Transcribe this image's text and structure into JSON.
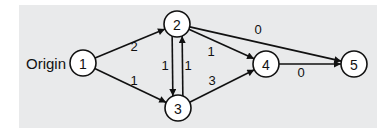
{
  "diagram": {
    "type": "directed-network",
    "origin_label": "Origin",
    "background": "#e9eaeb",
    "nodes": [
      {
        "id": "1",
        "label": "1",
        "x": 83,
        "y": 63
      },
      {
        "id": "2",
        "label": "2",
        "x": 177,
        "y": 24
      },
      {
        "id": "3",
        "label": "3",
        "x": 178,
        "y": 108
      },
      {
        "id": "4",
        "label": "4",
        "x": 266,
        "y": 64
      },
      {
        "id": "5",
        "label": "5",
        "x": 354,
        "y": 64
      }
    ],
    "edges": [
      {
        "from": "1",
        "to": "2",
        "weight": "2",
        "lx": 134,
        "ly": 46
      },
      {
        "from": "1",
        "to": "3",
        "weight": "1",
        "lx": 134,
        "ly": 80
      },
      {
        "from": "2",
        "to": "3",
        "weight": "1",
        "lx": 165,
        "ly": 65
      },
      {
        "from": "3",
        "to": "2",
        "weight": "1",
        "lx": 188,
        "ly": 65
      },
      {
        "from": "2",
        "to": "4",
        "weight": "1",
        "lx": 211,
        "ly": 51
      },
      {
        "from": "2",
        "to": "5",
        "weight": "0",
        "lx": 258,
        "ly": 29
      },
      {
        "from": "3",
        "to": "4",
        "weight": "3",
        "lx": 212,
        "ly": 80
      },
      {
        "from": "4",
        "to": "5",
        "weight": "0",
        "lx": 301,
        "ly": 72
      }
    ]
  }
}
